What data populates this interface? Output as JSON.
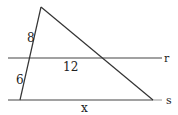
{
  "diagram": {
    "labels": {
      "segment_upper_left": "8",
      "segment_lower_left": "6",
      "segment_r": "12",
      "segment_s": "x",
      "line_r": "r",
      "line_s": "s"
    },
    "colors": {
      "stroke": "#333333",
      "text": "#222222"
    }
  }
}
